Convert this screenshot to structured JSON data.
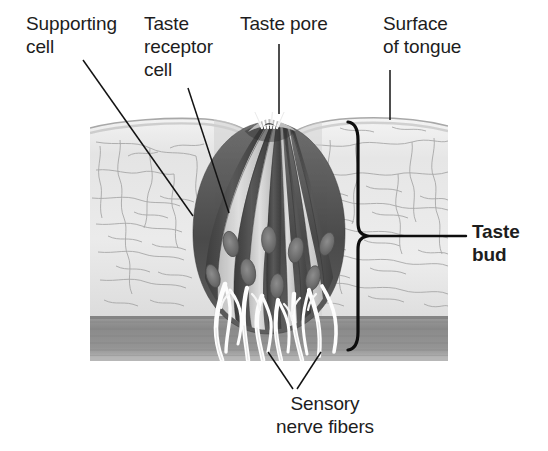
{
  "figure": {
    "type": "anatomical-illustration",
    "palette": {
      "background": "#ffffff",
      "label_text": "#1d1d1d",
      "leader_line": "#111111",
      "epithelium_light": "#e8e8e8",
      "epithelium_mid": "#cfcfcf",
      "epithelium_outline": "#9a9a9a",
      "cell_dark": "#5b5b5b",
      "cell_darker": "#3f3f3f",
      "cell_light": "#d8d8d8",
      "nucleus": "#707070",
      "connective_band": "#8d8d8d",
      "nerve_fiber": "#fbfbfb",
      "bracket": "#0d0d0d"
    }
  },
  "labels": {
    "supporting_cell": "Supporting\ncell",
    "taste_receptor_cell": "Taste\nreceptor\ncell",
    "taste_pore": "Taste pore",
    "surface_of_tongue": "Surface\nof tongue",
    "taste_bud": "Taste\nbud",
    "sensory_nerve_fibers": "Sensory\nnerve fibers"
  },
  "icons": {
    "leader_line": "leader-line-icon",
    "bracket": "curly-brace-bracket-icon",
    "taste_pore_marker": "taste-pore-icon"
  },
  "structures": [
    {
      "name": "surface-of-tongue",
      "description": "Stratified squamous epithelium with visible cell boundary network"
    },
    {
      "name": "taste-pore",
      "description": "Small opening at the tongue surface with microvilli projecting upward"
    },
    {
      "name": "taste-receptor-cell",
      "description": "Dark elongated spindle cells with oval nuclei radiating from the pore"
    },
    {
      "name": "supporting-cell",
      "description": "Light elongated cells alternating with receptor cells"
    },
    {
      "name": "taste-bud",
      "description": "Onion shaped cluster of receptor and supporting cells bracketed on the right"
    },
    {
      "name": "sensory-nerve-fibers",
      "description": "Pale branching fibers entering the base of the taste bud from connective tissue"
    },
    {
      "name": "connective-tissue-band",
      "description": "Darker horizontal band beneath the epithelium"
    }
  ]
}
